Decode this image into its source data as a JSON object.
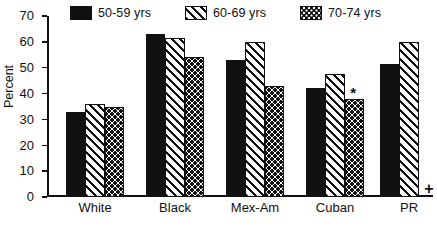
{
  "chart_data": {
    "type": "bar",
    "title": "",
    "xlabel": "",
    "ylabel": "Percent",
    "ylim": [
      0,
      70
    ],
    "yticks": [
      0,
      10,
      20,
      30,
      40,
      50,
      60,
      70
    ],
    "grid": false,
    "legend_position": "top",
    "categories": [
      "White",
      "Black",
      "Mex-Am",
      "Cuban",
      "PR"
    ],
    "series": [
      {
        "name": "50-59 yrs",
        "pattern": "solid-black",
        "values": [
          33,
          63,
          53,
          42,
          51.5
        ]
      },
      {
        "name": "60-69 yrs",
        "pattern": "diagonal-hatch",
        "values": [
          36,
          61.5,
          60,
          47.5,
          60
        ]
      },
      {
        "name": "70-74 yrs",
        "pattern": "dotted",
        "values": [
          35,
          54,
          43,
          38,
          null
        ]
      }
    ],
    "annotations": [
      {
        "symbol": "*",
        "category": "Cuban",
        "series": "70-74 yrs"
      },
      {
        "symbol": "+",
        "category": "PR",
        "series": "70-74 yrs"
      }
    ]
  },
  "legend": {
    "items": [
      {
        "label": "50-59 yrs",
        "pattern": "solid-black"
      },
      {
        "label": "60-69 yrs",
        "pattern": "diagonal-hatch"
      },
      {
        "label": "70-74 yrs",
        "pattern": "dotted"
      }
    ]
  },
  "axis": {
    "y_label": "Percent",
    "y_ticks": [
      "70",
      "60",
      "50",
      "40",
      "30",
      "20",
      "10",
      "0"
    ]
  },
  "footnote": {
    "text": ""
  },
  "colors": {
    "ink": "#111111",
    "background": "#ffffff"
  }
}
